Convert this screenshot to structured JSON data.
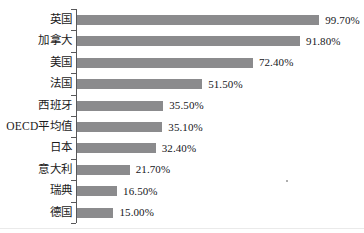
{
  "chart_data": {
    "type": "bar",
    "orientation": "horizontal",
    "title": "",
    "xlabel": "",
    "ylabel": "",
    "grid": false,
    "legend": "none",
    "xlim": [
      0,
      99.7
    ],
    "value_suffix": "%",
    "categories": [
      "英国",
      "加拿大",
      "美国",
      "法国",
      "西班牙",
      "OECD平均值",
      "日本",
      "意大利",
      "瑞典",
      "德国"
    ],
    "values": [
      99.7,
      91.8,
      72.4,
      51.5,
      35.5,
      35.1,
      32.4,
      21.7,
      16.5,
      15.0
    ],
    "value_labels": [
      "99.70%",
      "91.80%",
      "72.40%",
      "51.50%",
      "35.50%",
      "35.10%",
      "32.40%",
      "21.70%",
      "16.50%",
      "15.00%"
    ],
    "bar_color": "#8b8b8d",
    "axis_color": "#58585a",
    "text_color": "#1b1b1b"
  },
  "rows": [
    {
      "label": "英国",
      "value": 99.7,
      "value_label": "99.70%"
    },
    {
      "label": "加拿大",
      "value": 91.8,
      "value_label": "91.80%"
    },
    {
      "label": "美国",
      "value": 72.4,
      "value_label": "72.40%"
    },
    {
      "label": "法国",
      "value": 51.5,
      "value_label": "51.50%"
    },
    {
      "label": "西班牙",
      "value": 35.5,
      "value_label": "35.50%"
    },
    {
      "label": "OECD平均值",
      "value": 35.1,
      "value_label": "35.10%"
    },
    {
      "label": "日本",
      "value": 32.4,
      "value_label": "32.40%"
    },
    {
      "label": "意大利",
      "value": 21.7,
      "value_label": "21.70%"
    },
    {
      "label": "瑞典",
      "value": 16.5,
      "value_label": "16.50%"
    },
    {
      "label": "德国",
      "value": 15.0,
      "value_label": "15.00%"
    }
  ]
}
